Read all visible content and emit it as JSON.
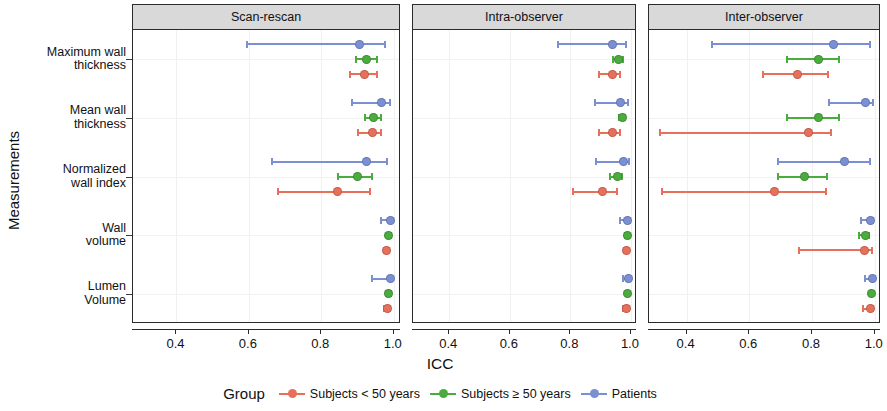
{
  "chart_data": {
    "type": "scatter",
    "plot_kind": "forest-plot-dot-with-error-bars",
    "title": "",
    "xlabel": "ICC",
    "ylabel": "Measurements",
    "xlim": [
      0.28,
      1.02
    ],
    "xticks": [
      0.4,
      0.6,
      0.8,
      1.0
    ],
    "xtick_labels": [
      "0.4",
      "0.6",
      "0.8",
      "1.0"
    ],
    "grid": true,
    "legend_position": "bottom",
    "legend_title": "Group",
    "categories": [
      "Maximum wall thickness",
      "Mean wall thickness",
      "Normalized wall index",
      "Wall volume",
      "Lumen Volume"
    ],
    "category_labels_wrapped": [
      [
        "Maximum wall",
        "thickness"
      ],
      [
        "Mean wall",
        "thickness"
      ],
      [
        "Normalized",
        "wall index"
      ],
      [
        "Wall",
        "volume"
      ],
      [
        "Lumen",
        "Volume"
      ]
    ],
    "panels": [
      "Scan-rescan",
      "Intra-observer",
      "Inter-observer"
    ],
    "series": [
      {
        "name": "Subjects < 50 years",
        "color": "#e8705a"
      },
      {
        "name": "Subjects ≥ 50 years",
        "color": "#4aab3e"
      },
      {
        "name": "Patients",
        "color": "#7b8fd4"
      }
    ],
    "data": [
      {
        "panel": "Scan-rescan",
        "points": [
          {
            "measurement": "Maximum wall thickness",
            "group": "Patients",
            "icc": 0.905,
            "ci_low": 0.595,
            "ci_high": 0.975
          },
          {
            "measurement": "Maximum wall thickness",
            "group": "Subjects ≥ 50 years",
            "icc": 0.925,
            "ci_low": 0.895,
            "ci_high": 0.955
          },
          {
            "measurement": "Maximum wall thickness",
            "group": "Subjects < 50 years",
            "icc": 0.92,
            "ci_low": 0.88,
            "ci_high": 0.955
          },
          {
            "measurement": "Mean wall thickness",
            "group": "Patients",
            "icc": 0.965,
            "ci_low": 0.885,
            "ci_high": 0.99
          },
          {
            "measurement": "Mean wall thickness",
            "group": "Subjects ≥ 50 years",
            "icc": 0.945,
            "ci_low": 0.92,
            "ci_high": 0.965
          },
          {
            "measurement": "Mean wall thickness",
            "group": "Subjects < 50 years",
            "icc": 0.94,
            "ci_low": 0.9,
            "ci_high": 0.965
          },
          {
            "measurement": "Normalized wall index",
            "group": "Patients",
            "icc": 0.925,
            "ci_low": 0.665,
            "ci_high": 0.98
          },
          {
            "measurement": "Normalized wall index",
            "group": "Subjects ≥ 50 years",
            "icc": 0.9,
            "ci_low": 0.845,
            "ci_high": 0.94
          },
          {
            "measurement": "Normalized wall index",
            "group": "Subjects < 50 years",
            "icc": 0.845,
            "ci_low": 0.68,
            "ci_high": 0.935
          },
          {
            "measurement": "Wall volume",
            "group": "Patients",
            "icc": 0.99,
            "ci_low": 0.965,
            "ci_high": 0.995
          },
          {
            "measurement": "Wall volume",
            "group": "Subjects ≥ 50 years",
            "icc": 0.985,
            "ci_low": 0.98,
            "ci_high": 0.992
          },
          {
            "measurement": "Wall volume",
            "group": "Subjects < 50 years",
            "icc": 0.98,
            "ci_low": 0.972,
            "ci_high": 0.988
          },
          {
            "measurement": "Lumen Volume",
            "group": "Patients",
            "icc": 0.99,
            "ci_low": 0.94,
            "ci_high": 0.996
          },
          {
            "measurement": "Lumen Volume",
            "group": "Subjects ≥ 50 years",
            "icc": 0.985,
            "ci_low": 0.978,
            "ci_high": 0.992
          },
          {
            "measurement": "Lumen Volume",
            "group": "Subjects < 50 years",
            "icc": 0.982,
            "ci_low": 0.972,
            "ci_high": 0.99
          }
        ]
      },
      {
        "panel": "Intra-observer",
        "points": [
          {
            "measurement": "Maximum wall thickness",
            "group": "Patients",
            "icc": 0.94,
            "ci_low": 0.76,
            "ci_high": 0.985
          },
          {
            "measurement": "Maximum wall thickness",
            "group": "Subjects ≥ 50 years",
            "icc": 0.96,
            "ci_low": 0.94,
            "ci_high": 0.975
          },
          {
            "measurement": "Maximum wall thickness",
            "group": "Subjects < 50 years",
            "icc": 0.938,
            "ci_low": 0.895,
            "ci_high": 0.965
          },
          {
            "measurement": "Mean wall thickness",
            "group": "Patients",
            "icc": 0.965,
            "ci_low": 0.88,
            "ci_high": 0.99
          },
          {
            "measurement": "Mean wall thickness",
            "group": "Subjects ≥ 50 years",
            "icc": 0.972,
            "ci_low": 0.96,
            "ci_high": 0.982
          },
          {
            "measurement": "Mean wall thickness",
            "group": "Subjects < 50 years",
            "icc": 0.938,
            "ci_low": 0.895,
            "ci_high": 0.965
          },
          {
            "measurement": "Normalized wall index",
            "group": "Patients",
            "icc": 0.975,
            "ci_low": 0.885,
            "ci_high": 0.992
          },
          {
            "measurement": "Normalized wall index",
            "group": "Subjects ≥ 50 years",
            "icc": 0.955,
            "ci_low": 0.93,
            "ci_high": 0.972
          },
          {
            "measurement": "Normalized wall index",
            "group": "Subjects < 50 years",
            "icc": 0.905,
            "ci_low": 0.81,
            "ci_high": 0.955
          },
          {
            "measurement": "Wall volume",
            "group": "Patients",
            "icc": 0.99,
            "ci_low": 0.965,
            "ci_high": 0.996
          },
          {
            "measurement": "Wall volume",
            "group": "Subjects ≥ 50 years",
            "icc": 0.988,
            "ci_low": 0.982,
            "ci_high": 0.993
          },
          {
            "measurement": "Wall volume",
            "group": "Subjects < 50 years",
            "icc": 0.985,
            "ci_low": 0.978,
            "ci_high": 0.991
          },
          {
            "measurement": "Lumen Volume",
            "group": "Patients",
            "icc": 0.992,
            "ci_low": 0.975,
            "ci_high": 0.997
          },
          {
            "measurement": "Lumen Volume",
            "group": "Subjects ≥ 50 years",
            "icc": 0.99,
            "ci_low": 0.985,
            "ci_high": 0.994
          },
          {
            "measurement": "Lumen Volume",
            "group": "Subjects < 50 years",
            "icc": 0.986,
            "ci_low": 0.975,
            "ci_high": 0.992
          }
        ]
      },
      {
        "panel": "Inter-observer",
        "points": [
          {
            "measurement": "Maximum wall thickness",
            "group": "Patients",
            "icc": 0.87,
            "ci_low": 0.48,
            "ci_high": 0.985
          },
          {
            "measurement": "Maximum wall thickness",
            "group": "Subjects ≥ 50 years",
            "icc": 0.82,
            "ci_low": 0.72,
            "ci_high": 0.885
          },
          {
            "measurement": "Maximum wall thickness",
            "group": "Subjects < 50 years",
            "icc": 0.755,
            "ci_low": 0.645,
            "ci_high": 0.85
          },
          {
            "measurement": "Mean wall thickness",
            "group": "Patients",
            "icc": 0.972,
            "ci_low": 0.855,
            "ci_high": 0.995
          },
          {
            "measurement": "Mean wall thickness",
            "group": "Subjects ≥ 50 years",
            "icc": 0.822,
            "ci_low": 0.72,
            "ci_high": 0.885
          },
          {
            "measurement": "Mean wall thickness",
            "group": "Subjects < 50 years",
            "icc": 0.79,
            "ci_low": 0.315,
            "ci_high": 0.86
          },
          {
            "measurement": "Normalized wall index",
            "group": "Patients",
            "icc": 0.905,
            "ci_low": 0.69,
            "ci_high": 0.985
          },
          {
            "measurement": "Normalized wall index",
            "group": "Subjects ≥ 50 years",
            "icc": 0.775,
            "ci_low": 0.69,
            "ci_high": 0.848
          },
          {
            "measurement": "Normalized wall index",
            "group": "Subjects < 50 years",
            "icc": 0.68,
            "ci_low": 0.32,
            "ci_high": 0.845
          },
          {
            "measurement": "Wall volume",
            "group": "Patients",
            "icc": 0.988,
            "ci_low": 0.955,
            "ci_high": 0.996
          },
          {
            "measurement": "Wall volume",
            "group": "Subjects ≥ 50 years",
            "icc": 0.97,
            "ci_low": 0.95,
            "ci_high": 0.982
          },
          {
            "measurement": "Wall volume",
            "group": "Subjects < 50 years",
            "icc": 0.968,
            "ci_low": 0.76,
            "ci_high": 0.99
          },
          {
            "measurement": "Lumen Volume",
            "group": "Patients",
            "icc": 0.992,
            "ci_low": 0.968,
            "ci_high": 0.998
          },
          {
            "measurement": "Lumen Volume",
            "group": "Subjects ≥ 50 years",
            "icc": 0.99,
            "ci_low": 0.984,
            "ci_high": 0.995
          },
          {
            "measurement": "Lumen Volume",
            "group": "Subjects < 50 years",
            "icc": 0.988,
            "ci_low": 0.962,
            "ci_high": 0.996
          }
        ]
      }
    ]
  }
}
